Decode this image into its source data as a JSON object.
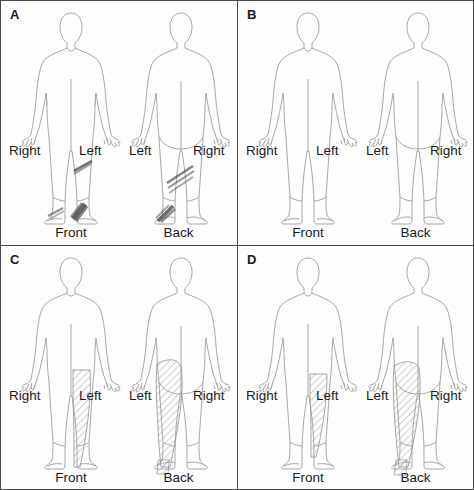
{
  "figure": {
    "type": "pain-body-diagram-grid",
    "rows": 2,
    "columns": 2,
    "background_color": "#fdfdfd",
    "outline_color": "#9a9a9a",
    "marking_color": "#555555",
    "border_color": "#4a4a4a"
  },
  "labels": {
    "right": "Right",
    "left": "Left",
    "front": "Front",
    "back": "Back"
  },
  "panels": [
    {
      "id": "A",
      "letter": "A",
      "views": [
        {
          "name": "front",
          "view_label": "Front",
          "left_side_label": "Right",
          "right_side_label": "Left",
          "markings": [
            {
              "region": "left-shin",
              "style": "dark-streak",
              "intensity": "medium"
            },
            {
              "region": "left-foot-dorsum",
              "style": "dark-streak",
              "intensity": "high"
            },
            {
              "region": "left-ankle-medial",
              "style": "dark-streak",
              "intensity": "medium"
            }
          ]
        },
        {
          "name": "back",
          "view_label": "Back",
          "left_side_label": "Left",
          "right_side_label": "Right",
          "markings": [
            {
              "region": "left-calf",
              "style": "dark-streak-band",
              "intensity": "medium"
            },
            {
              "region": "left-heel",
              "style": "dark-streak",
              "intensity": "high"
            }
          ]
        }
      ]
    },
    {
      "id": "B",
      "letter": "B",
      "views": [
        {
          "name": "front",
          "view_label": "Front",
          "left_side_label": "Right",
          "right_side_label": "Left",
          "markings": []
        },
        {
          "name": "back",
          "view_label": "Back",
          "left_side_label": "Left",
          "right_side_label": "Right",
          "markings": []
        }
      ]
    },
    {
      "id": "C",
      "letter": "C",
      "views": [
        {
          "name": "front",
          "view_label": "Front",
          "left_side_label": "Right",
          "right_side_label": "Left",
          "markings": [
            {
              "region": "left-thigh-anterior",
              "style": "diagonal-hatch",
              "intensity": "medium"
            },
            {
              "region": "left-shin-anterior",
              "style": "diagonal-hatch",
              "intensity": "medium"
            },
            {
              "region": "left-foot-dorsum",
              "style": "diagonal-hatch",
              "intensity": "light"
            }
          ]
        },
        {
          "name": "back",
          "view_label": "Back",
          "left_side_label": "Left",
          "right_side_label": "Right",
          "markings": [
            {
              "region": "left-buttock",
              "style": "diagonal-hatch",
              "intensity": "medium"
            },
            {
              "region": "left-thigh-posterior",
              "style": "diagonal-hatch",
              "intensity": "medium"
            },
            {
              "region": "left-calf",
              "style": "diagonal-hatch",
              "intensity": "medium"
            },
            {
              "region": "left-heel",
              "style": "diagonal-hatch",
              "intensity": "light"
            }
          ]
        }
      ]
    },
    {
      "id": "D",
      "letter": "D",
      "views": [
        {
          "name": "front",
          "view_label": "Front",
          "left_side_label": "Right",
          "right_side_label": "Left",
          "markings": [
            {
              "region": "left-thigh-anterior",
              "style": "diagonal-hatch",
              "intensity": "medium"
            },
            {
              "region": "left-shin-anterior",
              "style": "diagonal-hatch",
              "intensity": "light"
            }
          ]
        },
        {
          "name": "back",
          "view_label": "Back",
          "left_side_label": "Left",
          "right_side_label": "Right",
          "markings": [
            {
              "region": "left-buttock",
              "style": "diagonal-hatch",
              "intensity": "medium"
            },
            {
              "region": "left-thigh-posterior",
              "style": "diagonal-hatch",
              "intensity": "medium"
            },
            {
              "region": "left-calf",
              "style": "diagonal-hatch",
              "intensity": "medium"
            },
            {
              "region": "left-foot",
              "style": "diagonal-hatch",
              "intensity": "light"
            }
          ]
        }
      ]
    }
  ]
}
